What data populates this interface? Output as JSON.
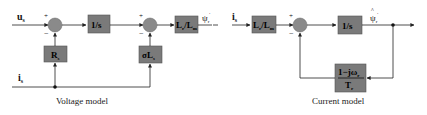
{
  "voltage_model": {
    "caption": "Voltage model",
    "inputs": {
      "us": "u",
      "us_sub": "s",
      "is": "i",
      "is_sub": "s"
    },
    "blocks": {
      "rs": {
        "main": "R",
        "sub": "s"
      },
      "integrator": "1/s",
      "sigma_ls": {
        "main": "σL",
        "sub": "s"
      },
      "lr_lm": {
        "a": "L",
        "a_sub": "r",
        "b": "/L",
        "b_sub": "m"
      }
    },
    "output": {
      "main": "ψ",
      "sub": "r",
      "sup": "'"
    },
    "signs": {
      "plus": "+",
      "minus": "−"
    }
  },
  "current_model": {
    "caption": "Current model",
    "inputs": {
      "is": "i",
      "is_sub": "s"
    },
    "blocks": {
      "lr_lm": {
        "a": "L",
        "a_sub": "r",
        "b": "/L",
        "b_sub": "m"
      },
      "integrator": "1/s",
      "feedback": {
        "num": "1−jω",
        "num_sub": "r",
        "den": "T",
        "den_sub": "r"
      }
    },
    "output": {
      "main": "ψ",
      "sub": "r",
      "sup": "'",
      "accent": "^"
    },
    "signs": {
      "plus": "+",
      "minus": "−"
    }
  },
  "colors": {
    "block": "#7a7a7a",
    "line": "#222222",
    "background": "#ffffff"
  }
}
